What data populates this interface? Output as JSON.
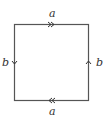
{
  "diagram": {
    "type": "fundamental-polygon",
    "edges": {
      "top": {
        "label": "a",
        "arrow": "double",
        "direction": "right"
      },
      "bottom": {
        "label": "a",
        "arrow": "double",
        "direction": "left"
      },
      "left": {
        "label": "b",
        "arrow": "single",
        "direction": "down"
      },
      "right": {
        "label": "b",
        "arrow": "single",
        "direction": "up"
      }
    },
    "colors": {
      "stroke": "#555555",
      "text": "#333333"
    }
  }
}
